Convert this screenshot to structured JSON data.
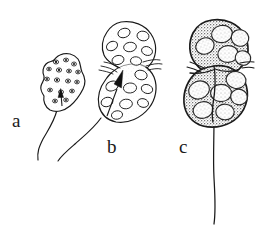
{
  "figure": {
    "caption_labels": [
      "a",
      "b",
      "c"
    ],
    "background_color": "#ffffff",
    "ink_color": "#1a1a1a",
    "panels": [
      {
        "label": "a",
        "name": "stage-a-cell",
        "description": "small irregular amoeboid cell with numerous small dark granules and a single trailing flagellum",
        "arrow": "black arrowhead pointing up into cell body",
        "shading": "unshaded outline",
        "granule_count": 15
      },
      {
        "label": "b",
        "name": "stage-b-cell",
        "description": "larger bilobed cell with numerous large oval vacuoles and a single trailing flagellum",
        "arrow": "black arrowhead pointing up into cell body",
        "shading": "light outline with faint stipple",
        "vacuole_count": 14
      },
      {
        "label": "c",
        "name": "stage-c-cell",
        "description": "dense darkly stippled bilobed cell packed with large rounded daughter bodies and a long straight trailing flagellum",
        "arrow": "none",
        "shading": "heavy grey stipple",
        "body_count": 9
      }
    ]
  },
  "labels": {
    "a": "a",
    "b": "b",
    "c": "c"
  }
}
